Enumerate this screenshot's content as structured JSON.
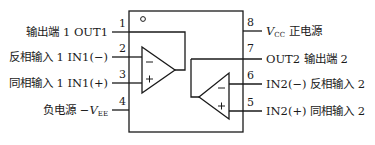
{
  "diagram": {
    "type": "dual op-amp 8-pin package pinout",
    "line_color": "#1a1a1a",
    "package": {
      "orientation_mark": "○",
      "left_pins": [
        {
          "num": "1",
          "label_cn": "输出端 1",
          "label_en": "OUT1"
        },
        {
          "num": "2",
          "label_cn": "反相输入 1",
          "label_en": "IN1(−)"
        },
        {
          "num": "3",
          "label_cn": "同相输入 1",
          "label_en": "IN1(+)"
        },
        {
          "num": "4",
          "label_cn": "负电源",
          "label_en": "−V",
          "subscript": "EE"
        }
      ],
      "right_pins": [
        {
          "num": "8",
          "label_en": "V",
          "subscript": "CC",
          "label_cn": "正电源"
        },
        {
          "num": "7",
          "label_en": "OUT2",
          "label_cn": "输出端 2"
        },
        {
          "num": "6",
          "label_en": "IN2(−)",
          "label_cn": "反相输入 2"
        },
        {
          "num": "5",
          "label_en": "IN2(+)",
          "label_cn": "同相输入 2"
        }
      ]
    },
    "amplifiers": [
      {
        "name": "op-amp 1",
        "inv_sign": "−",
        "noninv_sign": "+"
      },
      {
        "name": "op-amp 2",
        "inv_sign": "−",
        "noninv_sign": "+"
      }
    ]
  }
}
